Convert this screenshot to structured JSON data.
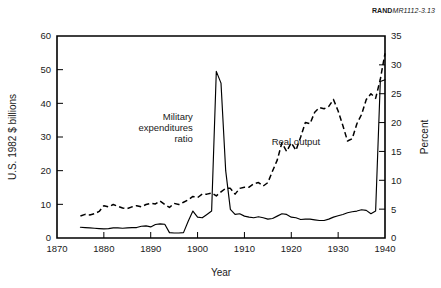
{
  "source_label": {
    "bold_prefix": "RAND",
    "rest": "MR1112-3.13"
  },
  "chart_data": {
    "type": "line",
    "title": "",
    "xlabel": "Year",
    "ylabel": "U.S. 1982 $ billions",
    "ylabel_right": "Percent",
    "xlim": [
      1870,
      1940
    ],
    "ylim": [
      0,
      60
    ],
    "ylim_right": [
      0,
      35
    ],
    "xticks": [
      1870,
      1880,
      1890,
      1900,
      1910,
      1920,
      1930,
      1940
    ],
    "xticklabels": [
      "1870",
      "1880",
      "1890",
      "1900",
      "1910",
      "1920",
      "1930",
      "1940"
    ],
    "yticks": [
      0,
      10,
      20,
      30,
      40,
      50,
      60
    ],
    "yticklabels": [
      "0",
      "10",
      "20",
      "30",
      "40",
      "50",
      "60"
    ],
    "yticks_right": [
      0,
      5,
      10,
      15,
      20,
      25,
      30,
      35
    ],
    "yticklabels_right": [
      "0",
      "5",
      "10",
      "15",
      "20",
      "25",
      "30",
      "35"
    ],
    "grid": false,
    "legend_position": "inline-annotations",
    "series": [
      {
        "name": "Military expenditures ratio",
        "axis": "left",
        "style": "solid",
        "label_position": {
          "x": 1899,
          "y": 35,
          "anchor": "end"
        },
        "x": [
          1875,
          1876,
          1877,
          1878,
          1879,
          1880,
          1881,
          1882,
          1883,
          1884,
          1885,
          1886,
          1887,
          1888,
          1889,
          1890,
          1891,
          1892,
          1893,
          1894,
          1895,
          1896,
          1897,
          1898,
          1899,
          1900,
          1901,
          1902,
          1903,
          1904,
          1905,
          1906,
          1907,
          1908,
          1909,
          1910,
          1911,
          1912,
          1913,
          1914,
          1915,
          1916,
          1917,
          1918,
          1919,
          1920,
          1921,
          1922,
          1923,
          1924,
          1925,
          1926,
          1927,
          1928,
          1929,
          1930,
          1931,
          1932,
          1933,
          1934,
          1935,
          1936,
          1937,
          1938,
          1939,
          1940
        ],
        "y": [
          3.2,
          3.1,
          3.0,
          2.9,
          2.8,
          2.7,
          2.8,
          3.0,
          3.0,
          2.9,
          3.0,
          3.1,
          3.1,
          3.5,
          3.6,
          3.3,
          4.0,
          4.2,
          4.1,
          1.6,
          1.5,
          1.5,
          1.6,
          5.0,
          8.0,
          6.2,
          6.0,
          7.0,
          8.0,
          49.5,
          46.0,
          20.0,
          8.5,
          7.0,
          7.2,
          6.5,
          6.2,
          6.0,
          6.3,
          6.0,
          5.6,
          5.8,
          6.5,
          7.2,
          7.0,
          6.2,
          6.0,
          5.5,
          5.6,
          5.6,
          5.4,
          5.2,
          5.2,
          5.6,
          6.2,
          6.6,
          7.0,
          7.5,
          7.8,
          8.0,
          8.4,
          8.2,
          7.2,
          8.0,
          46.5,
          47.0
        ]
      },
      {
        "name": "Real output",
        "axis": "right",
        "style": "dashed",
        "label_position": {
          "x": 1921,
          "y": 27.5,
          "anchor": "middle"
        },
        "x": [
          1875,
          1876,
          1877,
          1878,
          1879,
          1880,
          1881,
          1882,
          1883,
          1884,
          1885,
          1886,
          1887,
          1888,
          1889,
          1890,
          1891,
          1892,
          1893,
          1894,
          1895,
          1896,
          1897,
          1898,
          1899,
          1900,
          1901,
          1902,
          1903,
          1904,
          1905,
          1906,
          1907,
          1908,
          1909,
          1910,
          1911,
          1912,
          1913,
          1914,
          1915,
          1916,
          1917,
          1918,
          1919,
          1920,
          1921,
          1922,
          1923,
          1924,
          1925,
          1926,
          1927,
          1928,
          1929,
          1930,
          1931,
          1932,
          1933,
          1934,
          1935,
          1936,
          1937,
          1938,
          1939,
          1940
        ],
        "y": [
          3.8,
          4.1,
          4.0,
          4.2,
          4.6,
          5.6,
          5.4,
          5.8,
          5.5,
          5.2,
          5.1,
          5.4,
          5.6,
          5.4,
          5.8,
          6.0,
          5.9,
          6.4,
          5.8,
          5.3,
          6.0,
          5.8,
          6.2,
          6.6,
          7.2,
          7.0,
          7.6,
          7.6,
          7.8,
          7.3,
          8.0,
          8.6,
          8.6,
          7.6,
          8.6,
          8.8,
          8.8,
          9.4,
          9.6,
          9.0,
          9.6,
          11.6,
          13.5,
          16.5,
          15.0,
          16.5,
          15.2,
          17.5,
          20.0,
          19.8,
          21.8,
          22.6,
          22.4,
          22.8,
          24.0,
          22.0,
          19.5,
          16.8,
          17.2,
          19.8,
          21.4,
          24.0,
          25.0,
          24.2,
          27.5,
          32.0
        ]
      }
    ],
    "annotations": [
      {
        "text_lines": [
          "Military",
          "expenditures",
          "ratio"
        ],
        "x": 1899,
        "y": 35,
        "anchor": "end"
      },
      {
        "text_lines": [
          "Real output"
        ],
        "x": 1921,
        "y": 27.5,
        "anchor": "middle"
      }
    ]
  }
}
